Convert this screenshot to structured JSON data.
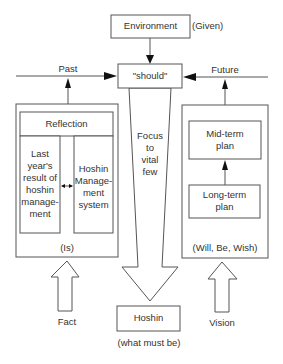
{
  "diagram": {
    "environment": {
      "label": "Environment",
      "note": "(Given)"
    },
    "should": {
      "label": "\"should\""
    },
    "past": {
      "label": "Past"
    },
    "future": {
      "label": "Future"
    },
    "focus": {
      "label": "Focus\nto\nvital\nfew"
    },
    "left_panel": {
      "header": "Reflection",
      "left_col": "Last\nyear's\nresult of\nhoshin\nmanage-\nment",
      "right_col": "Hoshin\nManage-\nment\nsystem",
      "footer": "(Is)"
    },
    "right_panel": {
      "top_box": "Mid-term\nplan",
      "bottom_box": "Long-term\nplan",
      "footer": "(Will, Be, Wish)"
    },
    "fact": {
      "label": "Fact"
    },
    "vision": {
      "label": "Vision"
    },
    "hoshin": {
      "label": "Hoshin",
      "note": "(what must be)"
    }
  }
}
